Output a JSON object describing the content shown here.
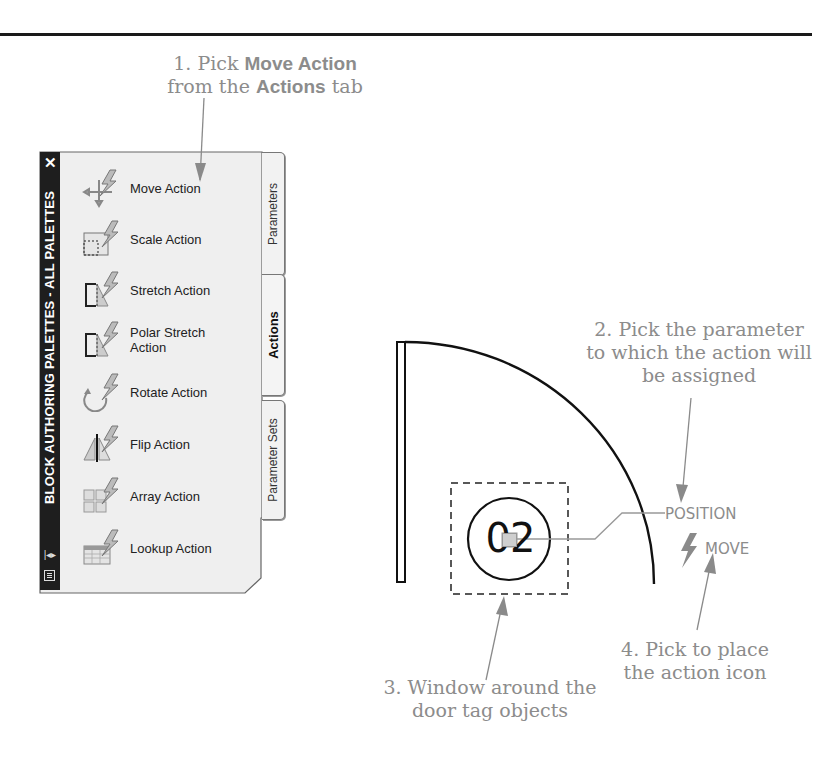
{
  "callouts": {
    "step1": {
      "prefix": "1. Pick ",
      "bold1": "Move Action",
      "mid": " from the ",
      "bold2": "Actions",
      "suffix": " tab"
    },
    "step2": "2. Pick the parameter to which the action will be assigned",
    "step3": "3. Window around the door tag objects",
    "step4": "4. Pick to place the action icon"
  },
  "palette": {
    "title": "BLOCK AUTHORING PALETTES - ALL PALETTES",
    "close_glyph": "✕",
    "tabs": [
      {
        "label": "Parameters",
        "active": false
      },
      {
        "label": "Actions",
        "active": true
      },
      {
        "label": "Parameter Sets",
        "active": false
      }
    ],
    "items": [
      {
        "label": "Move Action",
        "icon": "move-action-icon"
      },
      {
        "label": "Scale Action",
        "icon": "scale-action-icon"
      },
      {
        "label": "Stretch Action",
        "icon": "stretch-action-icon"
      },
      {
        "label": "Polar Stretch Action",
        "line1": "Polar Stretch",
        "line2": "Action",
        "icon": "polar-stretch-action-icon"
      },
      {
        "label": "Rotate Action",
        "icon": "rotate-action-icon"
      },
      {
        "label": "Flip Action",
        "icon": "flip-action-icon"
      },
      {
        "label": "Array Action",
        "icon": "array-action-icon"
      },
      {
        "label": "Lookup Action",
        "icon": "lookup-action-icon"
      }
    ]
  },
  "drawing": {
    "door_tag": "02",
    "parameter_label": "POSITION",
    "action_label": "MOVE",
    "colors": {
      "annotation": "#8c8c8c",
      "linework": "#111111",
      "grip": "#c8c8c8"
    }
  }
}
